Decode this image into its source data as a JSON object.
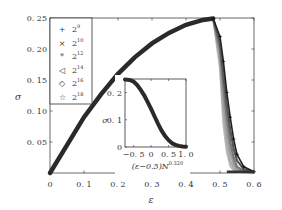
{
  "chart_data": {
    "type": "scatter",
    "title": "",
    "xlabel": "ε",
    "ylabel": "σ",
    "xlim": [
      0,
      0.6
    ],
    "ylim": [
      0,
      0.25
    ],
    "xticks": [
      "0",
      "0.1",
      "0.2",
      "0.3",
      "0.4",
      "0.5",
      "0.6"
    ],
    "yticks": [
      "0",
      "0.05",
      "0.10",
      "0.15",
      "0.20",
      "0.25"
    ],
    "grid": false,
    "legend_position": "upper left",
    "legend": [
      {
        "label": "2^9",
        "base": "2",
        "exp": "9",
        "marker": "+"
      },
      {
        "label": "2^10",
        "base": "2",
        "exp": "10",
        "marker": "×"
      },
      {
        "label": "2^12",
        "base": "2",
        "exp": "12",
        "marker": "*"
      },
      {
        "label": "2^14",
        "base": "2",
        "exp": "14",
        "marker": "◁"
      },
      {
        "label": "2^16",
        "base": "2",
        "exp": "16",
        "marker": "◇"
      },
      {
        "label": "2^18",
        "base": "2",
        "exp": "18",
        "marker": "☆"
      }
    ],
    "x": [
      0,
      0.05,
      0.1,
      0.15,
      0.2,
      0.25,
      0.3,
      0.35,
      0.4,
      0.45,
      0.48,
      0.5,
      0.51,
      0.52,
      0.53,
      0.54,
      0.55,
      0.57,
      0.6
    ],
    "series": [
      {
        "name": "2^9",
        "values": [
          0,
          0.045,
          0.09,
          0.127,
          0.16,
          0.187,
          0.209,
          0.226,
          0.239,
          0.247,
          0.249,
          0.22,
          0.18,
          0.13,
          0.09,
          0.055,
          0.03,
          0.01,
          0.002
        ]
      },
      {
        "name": "2^10",
        "values": [
          0,
          0.045,
          0.09,
          0.127,
          0.16,
          0.187,
          0.209,
          0.226,
          0.239,
          0.247,
          0.249,
          0.21,
          0.16,
          0.11,
          0.07,
          0.04,
          0.02,
          0.006,
          0.001
        ]
      },
      {
        "name": "2^12",
        "values": [
          0,
          0.045,
          0.09,
          0.127,
          0.16,
          0.187,
          0.209,
          0.226,
          0.239,
          0.247,
          0.249,
          0.2,
          0.14,
          0.09,
          0.05,
          0.025,
          0.01,
          0.003,
          0
        ]
      },
      {
        "name": "2^14",
        "values": [
          0,
          0.045,
          0.09,
          0.127,
          0.16,
          0.187,
          0.209,
          0.226,
          0.239,
          0.247,
          0.249,
          0.19,
          0.12,
          0.07,
          0.035,
          0.015,
          0.006,
          0.001,
          0
        ]
      },
      {
        "name": "2^16",
        "values": [
          0,
          0.045,
          0.09,
          0.127,
          0.16,
          0.187,
          0.209,
          0.226,
          0.239,
          0.247,
          0.249,
          0.18,
          0.1,
          0.05,
          0.02,
          0.008,
          0.003,
          0,
          0
        ]
      },
      {
        "name": "2^18",
        "values": [
          0,
          0.045,
          0.09,
          0.127,
          0.16,
          0.187,
          0.209,
          0.226,
          0.239,
          0.247,
          0.249,
          0.17,
          0.08,
          0.035,
          0.012,
          0.004,
          0.001,
          0,
          0
        ]
      }
    ],
    "inset": {
      "type": "scatter",
      "xlabel": "(ε−0.5)N^0.320",
      "xlabel_base": "(ε−0.5)N",
      "xlabel_exp": "0.320",
      "ylabel": "σ",
      "xlim": [
        -0.75,
        1.0
      ],
      "ylim": [
        0,
        0.25
      ],
      "xticks": [
        "−0.5",
        "0",
        "0.5",
        "1.0"
      ],
      "yticks": [
        "0",
        "0.1",
        "0.2"
      ],
      "x": [
        -0.75,
        -0.6,
        -0.5,
        -0.4,
        -0.3,
        -0.2,
        -0.1,
        0,
        0.1,
        0.2,
        0.3,
        0.4,
        0.5,
        0.6,
        0.7,
        0.8,
        0.9,
        1.0
      ],
      "values": [
        0.248,
        0.246,
        0.24,
        0.228,
        0.21,
        0.19,
        0.165,
        0.14,
        0.112,
        0.085,
        0.06,
        0.04,
        0.025,
        0.014,
        0.008,
        0.004,
        0.002,
        0.001
      ]
    }
  }
}
